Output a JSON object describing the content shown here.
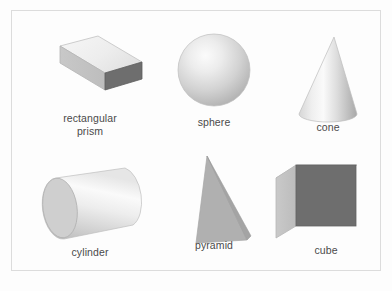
{
  "figure": {
    "background_color": "#fdfdfd",
    "frame_color": "#dcdcdc",
    "label_color": "#4a4a4a"
  },
  "palette": {
    "face_light": "#f2f2f2",
    "face_mid_light": "#d9d9d9",
    "face_mid": "#bfbfbf",
    "face_dark": "#6e6e6e",
    "face_darker": "#5f5f5f",
    "outline": "#b5b5b5"
  },
  "shapes": [
    {
      "id": "rectangular-prism",
      "label": "rectangular\nprism",
      "icon": "rectangular-prism-icon",
      "row": 1,
      "column": 1
    },
    {
      "id": "sphere",
      "label": "sphere",
      "icon": "sphere-icon",
      "row": 1,
      "column": 2
    },
    {
      "id": "cone",
      "label": "cone",
      "icon": "cone-icon",
      "row": 1,
      "column": 3
    },
    {
      "id": "cylinder",
      "label": "cylinder",
      "icon": "cylinder-icon",
      "row": 2,
      "column": 1
    },
    {
      "id": "pyramid",
      "label": "pyramid",
      "icon": "pyramid-icon",
      "row": 2,
      "column": 2
    },
    {
      "id": "cube",
      "label": "cube",
      "icon": "cube-icon",
      "row": 2,
      "column": 3
    }
  ]
}
